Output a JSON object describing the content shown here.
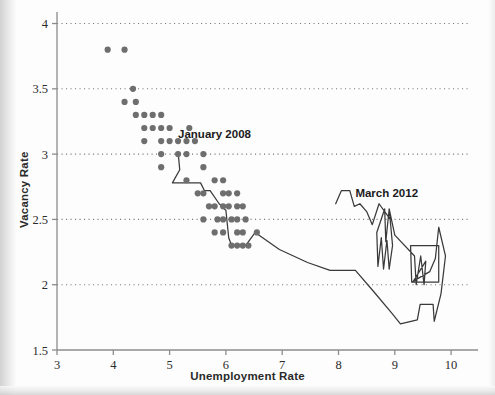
{
  "chart_data": {
    "type": "scatter",
    "title": "",
    "xlabel": "Unemployment Rate",
    "ylabel": "Vacancy Rate",
    "xlim": [
      3,
      10.3
    ],
    "ylim": [
      1.5,
      4.05
    ],
    "xticks": [
      "3",
      "4",
      "5",
      "6",
      "7",
      "8",
      "9",
      "10"
    ],
    "xtick_values": [
      3,
      4,
      5,
      6,
      7,
      8,
      9,
      10
    ],
    "yticks": [
      "1.5",
      "2",
      "2.5",
      "3",
      "3.5",
      "4"
    ],
    "ytick_values": [
      1.5,
      2,
      2.5,
      3,
      3.5,
      4
    ],
    "grid": "horizontal-dotted",
    "legend": "none",
    "annotations": [
      {
        "text": "January 2008",
        "x": 5.15,
        "y": 3.12
      },
      {
        "text": "March 2012",
        "x": 8.3,
        "y": 2.67
      }
    ],
    "scatter_points": [
      [
        3.9,
        3.8
      ],
      [
        4.2,
        3.8
      ],
      [
        4.35,
        3.5
      ],
      [
        4.2,
        3.4
      ],
      [
        4.4,
        3.4
      ],
      [
        4.4,
        3.3
      ],
      [
        4.55,
        3.3
      ],
      [
        4.7,
        3.3
      ],
      [
        4.85,
        3.3
      ],
      [
        4.55,
        3.2
      ],
      [
        4.7,
        3.2
      ],
      [
        4.85,
        3.2
      ],
      [
        5.0,
        3.2
      ],
      [
        5.35,
        3.2
      ],
      [
        4.55,
        3.1
      ],
      [
        4.85,
        3.1
      ],
      [
        5.0,
        3.1
      ],
      [
        5.15,
        3.1
      ],
      [
        5.3,
        3.1
      ],
      [
        5.45,
        3.1
      ],
      [
        4.85,
        3.0
      ],
      [
        5.15,
        3.0
      ],
      [
        5.3,
        3.0
      ],
      [
        5.6,
        3.0
      ],
      [
        4.85,
        2.9
      ],
      [
        5.6,
        2.9
      ],
      [
        5.3,
        2.8
      ],
      [
        5.8,
        2.8
      ],
      [
        5.95,
        2.8
      ],
      [
        5.5,
        2.7
      ],
      [
        5.6,
        2.7
      ],
      [
        5.95,
        2.7
      ],
      [
        6.05,
        2.7
      ],
      [
        6.2,
        2.7
      ],
      [
        5.7,
        2.6
      ],
      [
        5.8,
        2.6
      ],
      [
        5.95,
        2.6
      ],
      [
        6.05,
        2.6
      ],
      [
        6.2,
        2.6
      ],
      [
        6.3,
        2.6
      ],
      [
        5.6,
        2.5
      ],
      [
        5.85,
        2.5
      ],
      [
        5.95,
        2.5
      ],
      [
        6.1,
        2.5
      ],
      [
        6.2,
        2.5
      ],
      [
        6.35,
        2.5
      ],
      [
        5.8,
        2.4
      ],
      [
        5.95,
        2.4
      ],
      [
        6.2,
        2.4
      ],
      [
        6.3,
        2.4
      ],
      [
        6.55,
        2.4
      ],
      [
        6.1,
        2.3
      ],
      [
        6.2,
        2.3
      ],
      [
        6.3,
        2.3
      ],
      [
        6.4,
        2.3
      ]
    ],
    "line_path": [
      [
        5.15,
        3.02
      ],
      [
        5.18,
        2.88
      ],
      [
        5.05,
        2.78
      ],
      [
        5.55,
        2.78
      ],
      [
        5.62,
        2.72
      ],
      [
        5.72,
        2.72
      ],
      [
        5.88,
        2.62
      ],
      [
        6.0,
        2.57
      ],
      [
        6.05,
        2.36
      ],
      [
        6.1,
        2.3
      ],
      [
        6.35,
        2.3
      ],
      [
        6.52,
        2.4
      ],
      [
        6.95,
        2.27
      ],
      [
        7.45,
        2.17
      ],
      [
        7.85,
        2.11
      ],
      [
        8.3,
        2.11
      ],
      [
        8.62,
        1.95
      ],
      [
        8.95,
        1.78
      ],
      [
        9.1,
        1.7
      ],
      [
        9.4,
        1.73
      ],
      [
        9.45,
        1.85
      ],
      [
        9.68,
        1.85
      ],
      [
        9.7,
        1.72
      ],
      [
        9.82,
        1.93
      ],
      [
        9.9,
        2.22
      ],
      [
        9.78,
        2.44
      ],
      [
        9.72,
        2.2
      ],
      [
        9.62,
        2.1
      ],
      [
        9.3,
        2.02
      ],
      [
        9.28,
        2.3
      ],
      [
        9.78,
        2.3
      ],
      [
        9.78,
        2.02
      ],
      [
        9.32,
        2.02
      ],
      [
        9.55,
        2.18
      ],
      [
        9.52,
        2.0
      ],
      [
        9.46,
        2.22
      ],
      [
        9.38,
        2.0
      ],
      [
        9.35,
        2.22
      ],
      [
        9.0,
        2.38
      ],
      [
        8.9,
        2.58
      ],
      [
        8.96,
        2.3
      ],
      [
        8.9,
        2.12
      ],
      [
        8.86,
        2.34
      ],
      [
        8.8,
        2.12
      ],
      [
        8.76,
        2.36
      ],
      [
        8.7,
        2.14
      ],
      [
        8.68,
        2.4
      ],
      [
        8.82,
        2.58
      ],
      [
        8.84,
        2.33
      ],
      [
        8.9,
        2.58
      ],
      [
        8.92,
        2.5
      ],
      [
        8.72,
        2.62
      ],
      [
        8.6,
        2.46
      ],
      [
        8.5,
        2.56
      ],
      [
        8.38,
        2.62
      ],
      [
        8.28,
        2.6
      ],
      [
        8.2,
        2.72
      ],
      [
        8.05,
        2.72
      ],
      [
        7.95,
        2.62
      ]
    ]
  }
}
